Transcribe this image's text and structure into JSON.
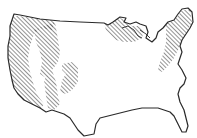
{
  "map": {
    "subject": "Contiguous United States outline",
    "style": "line drawing, black outline on white, diagonal hatching",
    "colors": {
      "outline": "#2a2a2a",
      "hatch": "#3a3a3a",
      "background": "#ffffff"
    },
    "shaded_regions": [
      {
        "name": "pacific-coast-and-cascades",
        "hatched": true
      },
      {
        "name": "northern-rockies",
        "hatched": true
      },
      {
        "name": "southern-rockies",
        "hatched": true
      },
      {
        "name": "great-lakes-upper-midwest",
        "hatched": true
      },
      {
        "name": "northeast-appalachians",
        "hatched": true
      }
    ],
    "labels": []
  }
}
